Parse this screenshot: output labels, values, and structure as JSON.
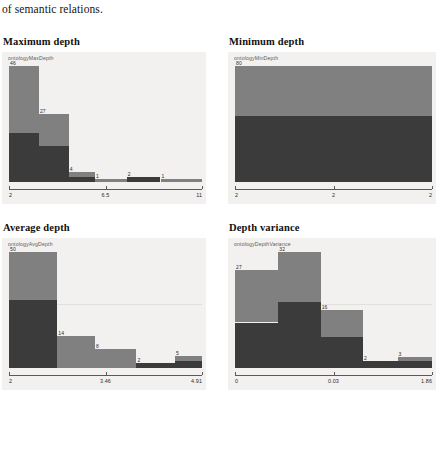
{
  "document": {
    "body_text": "of semantic relations."
  },
  "colors": {
    "bar_light": "#808080",
    "bar_dark": "#3b3b3b",
    "chart_background": "#f2f1ef",
    "axis": "#5a5a5a",
    "gridline": "#e2e0dd"
  },
  "sections": [
    {
      "title": "Maximum depth",
      "legend": "ontologyMaxDepth"
    },
    {
      "title": "Minimum depth",
      "legend": "ontologyMinDepth"
    },
    {
      "title": "Average depth",
      "legend": "ontologyAvgDepth"
    },
    {
      "title": "Depth variance",
      "legend": "ontologyDepthVariance"
    }
  ],
  "chart_data": [
    {
      "type": "bar",
      "title": "Maximum depth",
      "legend": "ontologyMaxDepth",
      "xlabel": "",
      "ylabel": "",
      "categories": [
        "2",
        "3",
        "4",
        "5",
        "7",
        "9"
      ],
      "values": [
        46,
        27,
        4,
        1,
        2,
        1
      ],
      "bar_labels": [
        "46",
        "27",
        "4",
        "1",
        "2",
        "1"
      ],
      "xticks": [
        "2",
        "6.5",
        "11"
      ],
      "xlim": [
        2,
        11
      ],
      "ylim": [
        0,
        46
      ],
      "grid": false,
      "legend_position": "top-left"
    },
    {
      "type": "bar",
      "title": "Minimum depth",
      "legend": "ontologyMinDepth",
      "xlabel": "",
      "ylabel": "",
      "categories": [
        "2"
      ],
      "values": [
        80
      ],
      "bar_labels": [
        "80"
      ],
      "xticks": [
        "2",
        "2",
        "2"
      ],
      "xlim": [
        2,
        2
      ],
      "ylim": [
        0,
        80
      ],
      "grid": false,
      "legend_position": "top-left"
    },
    {
      "type": "bar",
      "title": "Average depth",
      "legend": "ontologyAvgDepth",
      "xlabel": "",
      "ylabel": "",
      "categories": [
        "2",
        "2.58",
        "3.17",
        "3.75",
        "4.33"
      ],
      "values": [
        50,
        14,
        8,
        2,
        5
      ],
      "bar_labels": [
        "50",
        "14",
        "8",
        "2",
        "5"
      ],
      "xticks": [
        "2",
        "3.46",
        "4.91"
      ],
      "xlim": [
        2,
        4.91
      ],
      "ylim": [
        0,
        50
      ],
      "grid": true,
      "legend_position": "top-left"
    },
    {
      "type": "bar",
      "title": "Depth variance",
      "legend": "ontologyDepthVariance",
      "xlabel": "",
      "ylabel": "",
      "categories": [
        "0",
        "0.0124",
        "0.0248",
        "0.0372",
        "0.0496"
      ],
      "values": [
        27,
        32,
        16,
        2,
        3
      ],
      "bar_labels": [
        "27",
        "32",
        "16",
        "2",
        "3"
      ],
      "xticks": [
        "0",
        "0.03",
        "1.86"
      ],
      "xlim": [
        0,
        1.86
      ],
      "ylim": [
        0,
        32
      ],
      "grid": true,
      "legend_position": "top-left"
    }
  ]
}
